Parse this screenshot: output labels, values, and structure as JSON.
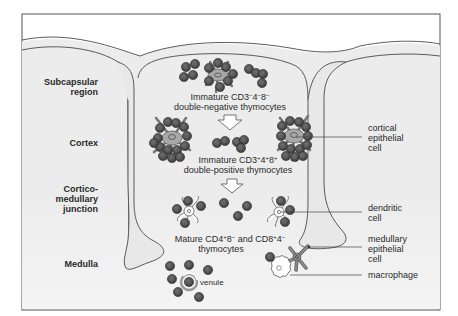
{
  "diagram": {
    "colors": {
      "background": "#ffffff",
      "frame": "#555555",
      "lobe_fill": "#e4e4e4",
      "septum_fill": "#ebebeb",
      "medulla_fill": "#f0f0f0",
      "thymocyte": "#4a4a4a",
      "thymocyte_edge": "#2e2e2e",
      "epithelial_fill": "#a8a8a8",
      "outline": "#3a3a3a",
      "text": "#2a2a2a"
    },
    "regions": [
      {
        "id": "subcapsular",
        "line1": "Subcapsular",
        "line2": "region"
      },
      {
        "id": "cortex",
        "line1": "Cortex"
      },
      {
        "id": "cortico-medullary",
        "line1": "Cortico-",
        "line2": "medullary",
        "line3": "junction"
      },
      {
        "id": "medulla",
        "line1": "Medulla"
      }
    ],
    "stages": {
      "dn": {
        "a": "Immature CD3",
        "sup1": "−",
        "b": "4",
        "sup2": "−",
        "c": "8",
        "sup3": "−",
        "line2": "double-negative thymocytes"
      },
      "dp": {
        "a": "Immature CD3",
        "sup1": "+",
        "b": "4",
        "sup2": "+",
        "c": "8",
        "sup3": "+",
        "line2": "double-positive thymocytes"
      },
      "sp": {
        "a": "Mature CD4",
        "sup1": "+",
        "b": "8",
        "sup2": "−",
        "c": " and CD8",
        "sup3": "+",
        "d": "4",
        "sup4": "−",
        "line2": "thymocytes"
      }
    },
    "cell_labels": {
      "cortical_epithelial": {
        "line1": "cortical",
        "line2": "epithelial",
        "line3": "cell"
      },
      "dendritic": {
        "line1": "dendritic",
        "line2": "cell"
      },
      "medullary_epithelial": {
        "line1": "medullary",
        "line2": "epithelial",
        "line3": "cell"
      },
      "macrophage": {
        "line1": "macrophage"
      },
      "venule": {
        "line1": "venule"
      }
    }
  }
}
